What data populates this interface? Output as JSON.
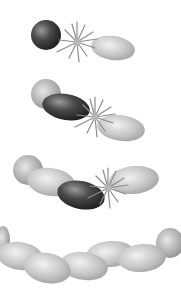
{
  "diagram": {
    "type": "polymerization-chain-growth",
    "colors": {
      "background": "#ffffff",
      "dark_unit": "#3a3a3a",
      "light_unit": "#c8c8c8",
      "starburst": "#8a8a8a"
    },
    "stages": [
      {
        "index": 1,
        "units_in_chain": 1,
        "has_starburst": true
      },
      {
        "index": 2,
        "units_in_chain": 2,
        "has_starburst": true
      },
      {
        "index": 3,
        "units_in_chain": 3,
        "has_starburst": true
      },
      {
        "index": 4,
        "units_in_chain": 6,
        "has_starburst": false
      }
    ]
  }
}
